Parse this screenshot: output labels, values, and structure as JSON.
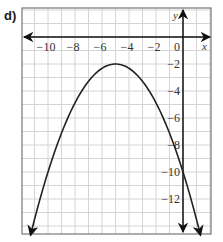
{
  "panel_label": "d)",
  "chart_data": {
    "type": "line",
    "title": "",
    "xlabel": "x",
    "ylabel": "y",
    "xlim": [
      -11.5,
      1.5
    ],
    "ylim": [
      -14.5,
      2
    ],
    "grid": true,
    "x_ticks": [
      -10,
      -8,
      -6,
      -4,
      -2,
      0
    ],
    "x_tick_labels": [
      "−10",
      "−8",
      "−6",
      "−4",
      "−2",
      "0"
    ],
    "y_ticks": [
      -2,
      -4,
      -6,
      -8,
      -10,
      -12
    ],
    "y_tick_labels": [
      "−2",
      "−4",
      "−6",
      "−8",
      "−10",
      "−12"
    ],
    "series": [
      {
        "name": "parabola",
        "equation": "y = -0.32(x + 5)^2 - 2",
        "vertex": [
          -5,
          -2
        ],
        "y_intercept": -10,
        "x": [
          -11.3,
          -10,
          -9,
          -8,
          -7,
          -6,
          -5,
          -4,
          -3,
          -2,
          -1,
          0,
          1.3
        ],
        "values": [
          -14.7,
          -10,
          -7.12,
          -4.88,
          -3.28,
          -2.32,
          -2,
          -2.32,
          -3.28,
          -4.88,
          -7.12,
          -10,
          -14.7
        ]
      }
    ]
  }
}
